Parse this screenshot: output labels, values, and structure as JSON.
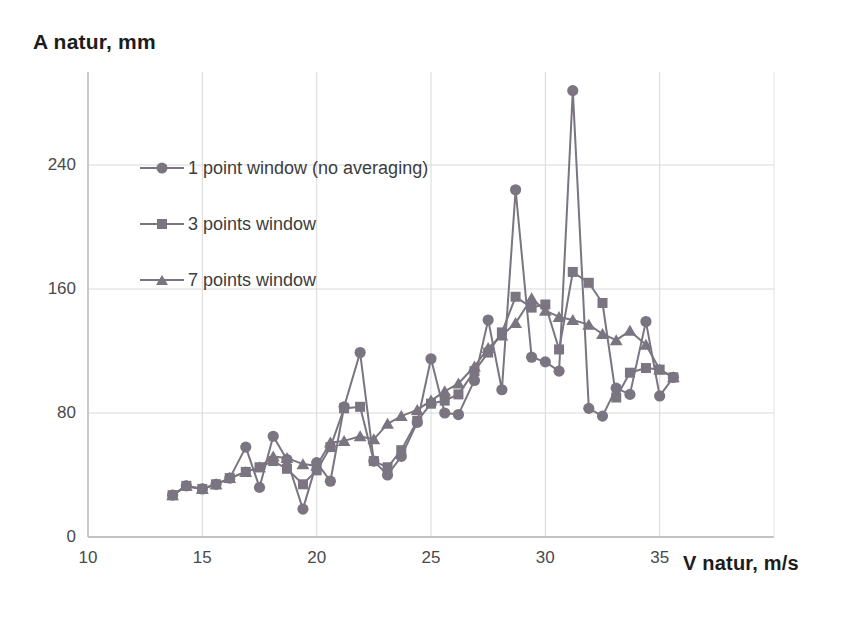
{
  "chart_data": {
    "type": "line",
    "title": "",
    "xlabel": "V natur, m/s",
    "ylabel": "A natur, mm",
    "xlim": [
      10,
      40
    ],
    "ylim": [
      0,
      300
    ],
    "xticks": [
      10,
      15,
      20,
      25,
      30,
      35
    ],
    "yticks": [
      0,
      80,
      160,
      240
    ],
    "grid": true,
    "legend_position": "upper-left-inside",
    "series_color": "#7a7580",
    "grid_color": "#d9d9d9",
    "axis_color": "#b5b5b5",
    "background": "#ffffff",
    "x": [
      13.7,
      14.3,
      15.0,
      15.6,
      16.2,
      16.9,
      17.5,
      18.1,
      18.7,
      19.4,
      20.0,
      20.6,
      21.2,
      21.9,
      22.5,
      23.1,
      23.7,
      24.4,
      25.0,
      25.6,
      26.2,
      26.9,
      27.5,
      28.1,
      28.7,
      29.4,
      30.0,
      30.6,
      31.2,
      31.9,
      32.5,
      33.1,
      33.7,
      34.4,
      35.0,
      35.6
    ],
    "series": [
      {
        "name": "1 point window (no averaging)",
        "marker": "circle",
        "values": [
          27,
          33,
          31,
          34,
          38,
          58,
          32,
          65,
          50,
          18,
          48,
          36,
          84,
          119,
          49,
          40,
          52,
          74,
          115,
          80,
          79,
          101,
          140,
          95,
          224,
          116,
          113,
          107,
          288,
          83,
          78,
          96,
          92,
          139,
          91,
          103
        ]
      },
      {
        "name": "3 points window",
        "marker": "square",
        "values": [
          27,
          33,
          31,
          34,
          38,
          42,
          45,
          49,
          44,
          34,
          43,
          58,
          83,
          84,
          49,
          45,
          56,
          75,
          86,
          88,
          92,
          107,
          119,
          132,
          155,
          148,
          150,
          121,
          171,
          164,
          151,
          90,
          106,
          109,
          108,
          103
        ]
      },
      {
        "name": "7 points window",
        "marker": "triangle",
        "values": [
          27,
          33,
          31,
          34,
          38,
          42,
          45,
          52,
          51,
          47,
          46,
          61,
          62,
          65,
          63,
          73,
          78,
          82,
          88,
          94,
          99,
          110,
          122,
          130,
          138,
          154,
          146,
          142,
          140,
          137,
          131,
          127,
          133,
          124,
          108,
          103
        ]
      }
    ]
  },
  "legend": {
    "items": [
      {
        "label": "1 point window (no averaging)",
        "marker": "circle"
      },
      {
        "label": "3 points window",
        "marker": "square"
      },
      {
        "label": "7 points window",
        "marker": "triangle"
      }
    ]
  }
}
